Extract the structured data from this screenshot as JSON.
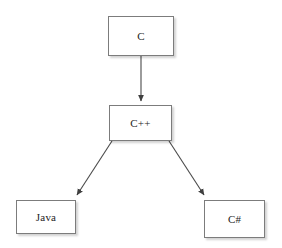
{
  "diagram": {
    "type": "flowchart",
    "canvas": {
      "width": 282,
      "height": 248,
      "background": "#ffffff"
    },
    "style": {
      "node_fill": "#ffffff",
      "node_border": "#7c7c7c",
      "edge_color": "#4a4a4a",
      "text_color": "#1d1d1d"
    },
    "nodes": [
      {
        "id": "c",
        "label": "C",
        "x": 108,
        "y": 16,
        "width": 66,
        "height": 40
      },
      {
        "id": "cpp",
        "label": "C++",
        "x": 109,
        "y": 105,
        "width": 63,
        "height": 36
      },
      {
        "id": "java",
        "label": "Java",
        "x": 16,
        "y": 200,
        "width": 60,
        "height": 34
      },
      {
        "id": "csharp",
        "label": "C#",
        "x": 204,
        "y": 200,
        "width": 61,
        "height": 38
      }
    ],
    "edges": [
      {
        "id": "c-to-cpp",
        "from": "C",
        "to": "C++",
        "x1": 141,
        "y1": 56,
        "x2": 141,
        "y2": 103,
        "arrowhead": "filled-triangle"
      },
      {
        "id": "cpp-to-java",
        "from": "C++",
        "to": "Java",
        "x1": 112,
        "y1": 141,
        "x2": 75,
        "y2": 198,
        "arrowhead": "filled-triangle"
      },
      {
        "id": "cpp-to-csharp",
        "from": "C++",
        "to": "C#",
        "x1": 169,
        "y1": 141,
        "x2": 206,
        "y2": 198,
        "arrowhead": "filled-triangle"
      }
    ]
  }
}
